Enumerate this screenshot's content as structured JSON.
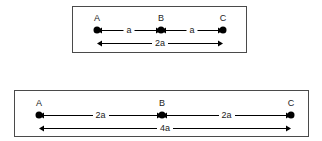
{
  "figure": {
    "title": "",
    "background_color": "#ffffff",
    "line_color": "#000000",
    "border_color": "#4a4a4a",
    "text_color": "#1a1a1a"
  },
  "panels": [
    {
      "id": "top",
      "points": [
        {
          "label": "A",
          "x": 96
        },
        {
          "label": "B",
          "x": 160
        },
        {
          "label": "C",
          "x": 222
        }
      ],
      "segment_dimensions": [
        {
          "label": "a",
          "from": "A",
          "to": "B",
          "x1": 96,
          "x2": 160
        },
        {
          "label": "a",
          "from": "B",
          "to": "C",
          "x1": 160,
          "x2": 222
        }
      ],
      "total_dimension": {
        "label": "2a",
        "from": "A",
        "to": "C",
        "x1": 96,
        "x2": 222
      }
    },
    {
      "id": "bottom",
      "points": [
        {
          "label": "A",
          "x": 38
        },
        {
          "label": "B",
          "x": 161
        },
        {
          "label": "C",
          "x": 290
        }
      ],
      "segment_dimensions": [
        {
          "label": "2a",
          "from": "A",
          "to": "B",
          "x1": 38,
          "x2": 161
        },
        {
          "label": "2a",
          "from": "B",
          "to": "C",
          "x1": 161,
          "x2": 290
        }
      ],
      "total_dimension": {
        "label": "4a",
        "from": "A",
        "to": "C",
        "x1": 38,
        "x2": 290
      }
    }
  ]
}
